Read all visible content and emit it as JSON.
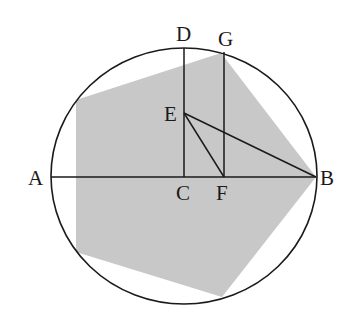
{
  "diagram": {
    "colors": {
      "background": "#ffffff",
      "stroke": "#1a1a1a",
      "pentagon_fill": "#c8c8c8"
    },
    "circle": {
      "cx": 184,
      "cy": 176,
      "rx": 133,
      "ry": 128
    },
    "pentagon": [
      [
        221,
        53
      ],
      [
        316,
        177
      ],
      [
        222,
        297
      ],
      [
        76,
        252
      ],
      [
        76,
        100
      ]
    ],
    "points": {
      "A": {
        "label": "A",
        "x": 51,
        "y": 177,
        "lx": 28,
        "ly": 185
      },
      "B": {
        "label": "B",
        "x": 316,
        "y": 177,
        "lx": 320,
        "ly": 185
      },
      "C": {
        "label": "C",
        "x": 184,
        "y": 177,
        "lx": 176,
        "ly": 200
      },
      "D": {
        "label": "D",
        "x": 184,
        "y": 48,
        "lx": 176,
        "ly": 41
      },
      "E": {
        "label": "E",
        "x": 184,
        "y": 113,
        "lx": 164,
        "ly": 121
      },
      "F": {
        "label": "F",
        "x": 224,
        "y": 177,
        "lx": 216,
        "ly": 200
      },
      "G": {
        "label": "G",
        "x": 224,
        "y": 52,
        "lx": 218,
        "ly": 46
      }
    },
    "segments": [
      "AB",
      "DC",
      "GF",
      "EB",
      "EF"
    ]
  }
}
